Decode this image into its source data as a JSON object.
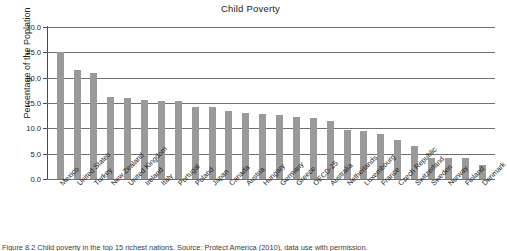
{
  "chart_data": {
    "type": "bar",
    "title": "Child Poverty",
    "xlabel": "",
    "ylabel": "Percentage of the Poplation",
    "ylim": [
      0.0,
      30.0
    ],
    "yticks": [
      "0.0",
      "5.0",
      "10.0",
      "15.0",
      "20.0",
      "25.0",
      "30.0"
    ],
    "ytick_values": [
      0.0,
      5.0,
      10.0,
      15.0,
      20.0,
      25.0,
      30.0
    ],
    "grid": true,
    "legend": "none",
    "bar_color": "#9a9a9a",
    "categories": [
      "Mexico",
      "United States",
      "Turkey",
      "New Zealand",
      "United Kingdom",
      "Ireland",
      "Italy",
      "Portugal",
      "Poland",
      "Japan",
      "Canada",
      "Austria",
      "Hungary",
      "Germany",
      "Greece",
      "OECD-25",
      "Australia",
      "Netherlands",
      "Luxembourg",
      "France",
      "Czech Republic",
      "Switzerland",
      "Sweden",
      "Norway",
      "Finland",
      "Denmark"
    ],
    "values": [
      25.0,
      21.6,
      20.9,
      16.2,
      16.0,
      15.5,
      15.4,
      15.4,
      14.3,
      14.2,
      13.5,
      13.1,
      12.9,
      12.6,
      12.3,
      12.0,
      11.4,
      9.6,
      9.5,
      8.9,
      7.7,
      6.6,
      4.2,
      4.2,
      4.1,
      2.7
    ]
  },
  "caption": {
    "text": "Figure 8.2 Child poverty in the top 15 richest nations. Source: Protect America (2010), data use with permission."
  }
}
